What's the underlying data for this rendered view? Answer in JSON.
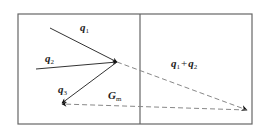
{
  "diagram": {
    "frame": {
      "left_panel": "",
      "right_panel": ""
    },
    "vectors": [
      {
        "id": "q1",
        "base": "q",
        "sub": "1",
        "style": "solid"
      },
      {
        "id": "q2",
        "base": "q",
        "sub": "2",
        "style": "solid"
      },
      {
        "id": "q3",
        "base": "q",
        "sub": "3",
        "style": "solid"
      },
      {
        "id": "q1_plus_q2",
        "base1": "q",
        "sub1": "1",
        "op": "+",
        "base2": "q",
        "sub2": "2",
        "style": "dashed"
      },
      {
        "id": "Gm",
        "base": "G",
        "sub": "m",
        "style": "dashed"
      }
    ],
    "colors": {
      "frame": "#666666",
      "solid_arrow": "#333333",
      "dashed_arrow": "#888888",
      "arrowhead": "#111111",
      "text": "#222222"
    }
  }
}
